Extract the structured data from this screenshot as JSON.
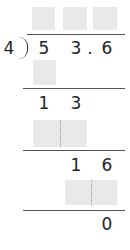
{
  "problem": {
    "divisor": "4",
    "dividend": [
      "5",
      "3",
      ".",
      "6"
    ],
    "quotient_boxes": 3,
    "step1_remainder": [
      "1",
      "3"
    ],
    "step2_remainder": [
      "1",
      "6"
    ],
    "final_remainder": "0"
  },
  "colors": {
    "box_fill": "#e9e9e9",
    "line": "#555555",
    "text": "#222222"
  }
}
